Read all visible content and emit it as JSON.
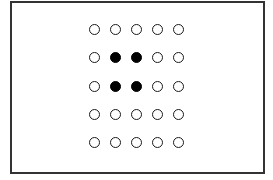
{
  "diagram": {
    "type": "dot-grid",
    "rows": 5,
    "cols": 5,
    "colors": {
      "frame": "#333333",
      "dot_outline": "#1a1a1a",
      "dot_fill": "#000000",
      "background": "#ffffff"
    },
    "layout": {
      "origin_x": 95,
      "origin_y": 30,
      "step_x": 21,
      "step_y": 28.3
    },
    "cells": [
      [
        0,
        0,
        0,
        0,
        0
      ],
      [
        0,
        1,
        1,
        0,
        0
      ],
      [
        0,
        1,
        1,
        0,
        0
      ],
      [
        0,
        0,
        0,
        0,
        0
      ],
      [
        0,
        0,
        0,
        0,
        0
      ]
    ]
  }
}
